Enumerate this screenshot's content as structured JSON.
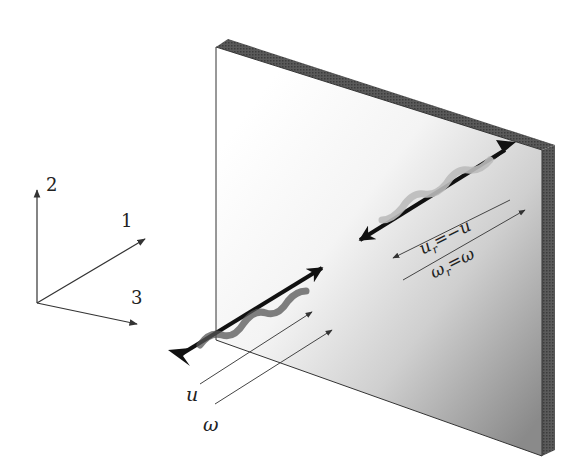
{
  "figure": {
    "type": "diagram",
    "axes": {
      "labels": [
        "2",
        "1",
        "3"
      ]
    },
    "incident": {
      "velocity_label": "u",
      "spin_label": "ω"
    },
    "reflected": {
      "velocity_label_main": "u",
      "velocity_label_sub": "r",
      "velocity_label_rhs": "=−u",
      "spin_label_main": "ω",
      "spin_label_sub": "r",
      "spin_label_rhs": "=ω"
    },
    "colors": {
      "line": "#333333",
      "plate_edge": "#4a4a4a",
      "plate_light": "#ffffff",
      "plate_dark": "#7a7a7a"
    }
  }
}
